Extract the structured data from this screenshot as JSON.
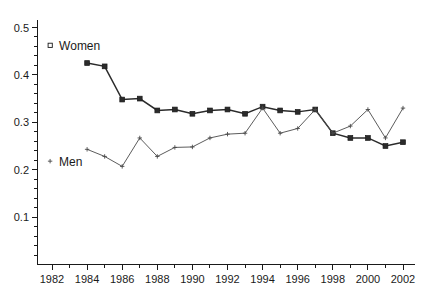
{
  "chart_data": {
    "type": "line",
    "title": "",
    "xlabel": "",
    "ylabel": "",
    "xlim": [
      1982,
      2002
    ],
    "ylim": [
      0.0,
      0.5
    ],
    "grid": false,
    "legend_position": "inside-left",
    "x_ticks": [
      1982,
      1984,
      1986,
      1988,
      1990,
      1992,
      1994,
      1996,
      1998,
      2000,
      2002
    ],
    "x_tick_labels": [
      "1982",
      "1984",
      "1986",
      "1988",
      "1990",
      "1992",
      "1994",
      "1996",
      "1998",
      "2000",
      "2002"
    ],
    "y_ticks": [
      0.1,
      0.2,
      0.3,
      0.4,
      0.5
    ],
    "y_tick_labels": [
      "0.1",
      "0.2",
      "0.3",
      "0.4",
      "0.5"
    ],
    "x": [
      1984,
      1985,
      1986,
      1987,
      1988,
      1989,
      1990,
      1991,
      1992,
      1993,
      1994,
      1995,
      1996,
      1997,
      1998,
      1999,
      2000,
      2001,
      2002
    ],
    "series": [
      {
        "name": "Women",
        "marker": "filled-square",
        "values": [
          0.425,
          0.418,
          0.348,
          0.35,
          0.325,
          0.327,
          0.318,
          0.325,
          0.327,
          0.318,
          0.333,
          0.325,
          0.322,
          0.327,
          0.277,
          0.267,
          0.267,
          0.25,
          0.258
        ]
      },
      {
        "name": "Men",
        "marker": "small-cross",
        "values": [
          0.243,
          0.228,
          0.207,
          0.267,
          0.228,
          0.247,
          0.248,
          0.267,
          0.275,
          0.277,
          0.33,
          0.277,
          0.287,
          0.327,
          0.277,
          0.292,
          0.327,
          0.267,
          0.33
        ]
      }
    ],
    "annotations": [
      {
        "text": "Women",
        "x": 1984.0,
        "y": 0.462,
        "marker": "open-square"
      },
      {
        "text": "Men",
        "x": 1984.0,
        "y": 0.218,
        "marker": "small-cross"
      }
    ],
    "colors": {
      "women_line": "#2b2b2b",
      "men_line": "#4a4a4a",
      "axis": "#1a1a1a",
      "background": "#ffffff"
    }
  }
}
